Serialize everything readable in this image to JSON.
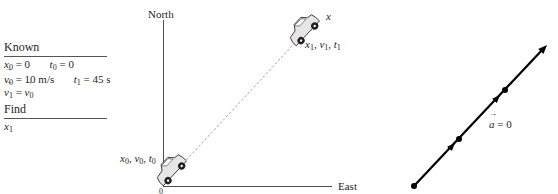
{
  "known_box": {
    "known_heading": "Known",
    "rows": [
      {
        "a_sym": "x",
        "a_sub": "0",
        "a_val": " = 0",
        "b_sym": "t",
        "b_sub": "0",
        "b_val": " = 0"
      },
      {
        "a_sym": "v",
        "a_sub": "0",
        "a_val": " = 10 m/s",
        "b_sym": "t",
        "b_sub": "1",
        "b_val": " = 45 s"
      },
      {
        "a_sym": "v",
        "a_sub": "1",
        "a_val": " = ",
        "c_sym": "v",
        "c_sub": "0"
      }
    ],
    "find_heading": "Find",
    "find_sym": "x",
    "find_sub": "1"
  },
  "pictorial": {
    "north_label": "North",
    "east_label": "East",
    "origin_label": "0",
    "x_axis_label": "x",
    "start_label": {
      "x": "x",
      "xs": "0",
      "v": "v",
      "vs": "0",
      "t": "t",
      "ts": "0"
    },
    "end_label": {
      "x": "x",
      "xs": "1",
      "v": "v",
      "vs": "1",
      "t": "t",
      "ts": "1"
    }
  },
  "motion_diagram": {
    "accel_sym": "a",
    "accel_val": " = 0",
    "dots": [
      [
        414,
        186
      ],
      [
        459,
        139
      ],
      [
        505,
        90
      ]
    ],
    "arrowheads": [
      [
        453,
        145
      ],
      [
        498,
        97
      ],
      [
        545,
        47
      ]
    ]
  },
  "colors": {
    "ink": "#231f20",
    "dash": "#8a8a8a",
    "car_body": "#e6e6e6"
  }
}
